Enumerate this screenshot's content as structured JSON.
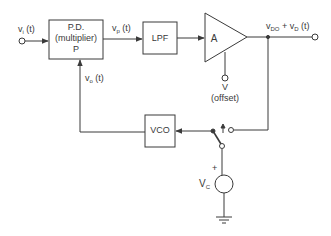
{
  "diagram": {
    "input": {
      "label_main": "v",
      "label_sub": "i",
      "label_suffix": " (t)"
    },
    "phase_detector": {
      "line1": "P.D.",
      "line2": "(multiplier)",
      "line3": "P"
    },
    "pd_output": {
      "label_main": "v",
      "label_sub": "p",
      "label_suffix": " (t)"
    },
    "lpf": {
      "label": "LPF"
    },
    "amplifier": {
      "label": "A"
    },
    "offset": {
      "line1": "V",
      "line2": "(offset)"
    },
    "output": {
      "part1_main": "v",
      "part1_sub": "DO",
      "plus": " + ",
      "part2_main": "v",
      "part2_sub": "D",
      "suffix": " (t)"
    },
    "vco": {
      "label": "VCO"
    },
    "vco_output": {
      "label_main": "v",
      "label_sub": "o",
      "label_suffix": " (t)"
    },
    "source": {
      "label_main": "V",
      "label_sub": "C",
      "polarity": "+"
    }
  }
}
